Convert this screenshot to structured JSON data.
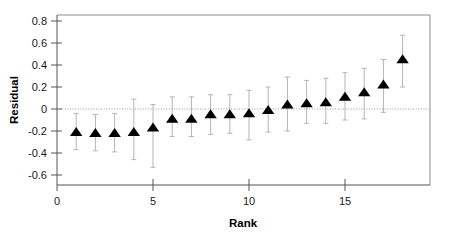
{
  "chart_data": {
    "type": "scatter",
    "title": "",
    "xlabel": "Rank",
    "ylabel": "Residual",
    "xlim": [
      0,
      19
    ],
    "ylim": [
      -0.72,
      0.86
    ],
    "xticks": [
      0,
      5,
      10,
      15
    ],
    "xtick_labels": [
      "0",
      "5",
      "10",
      "15"
    ],
    "yticks": [
      0.8,
      0.6,
      0.4,
      0.2,
      0,
      -0.2,
      -0.4,
      -0.6
    ],
    "ytick_labels": [
      "0.8",
      "0.6",
      "0.4",
      "0.2",
      "0",
      "-0.2",
      "-0.4",
      "-0.6"
    ],
    "grid": false,
    "zero_reference_line": 0,
    "legend": null,
    "marker": "triangle-up",
    "marker_color": "#000000",
    "errorbar_color": "#b4b4b4",
    "x": [
      1,
      2,
      3,
      4,
      5,
      6,
      7,
      8,
      9,
      10,
      11,
      12,
      13,
      14,
      15,
      16,
      17,
      18
    ],
    "values": [
      -0.21,
      -0.22,
      -0.22,
      -0.21,
      -0.17,
      -0.09,
      -0.09,
      -0.05,
      -0.05,
      -0.04,
      -0.01,
      0.04,
      0.05,
      0.06,
      0.11,
      0.15,
      0.22,
      0.45
    ],
    "err_low": [
      -0.37,
      -0.38,
      -0.39,
      -0.46,
      -0.53,
      -0.25,
      -0.25,
      -0.23,
      -0.22,
      -0.28,
      -0.21,
      -0.2,
      -0.13,
      -0.13,
      -0.1,
      -0.09,
      -0.03,
      0.2
    ],
    "err_high": [
      -0.04,
      -0.05,
      -0.04,
      0.09,
      0.04,
      0.11,
      0.11,
      0.13,
      0.13,
      0.17,
      0.2,
      0.29,
      0.26,
      0.28,
      0.33,
      0.37,
      0.45,
      0.67
    ]
  }
}
